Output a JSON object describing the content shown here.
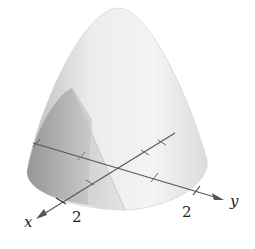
{
  "figure": {
    "type": "3d-surface-diagram",
    "colors": {
      "surface_light": "#f0f0f0",
      "surface_mid": "#d9d9d9",
      "surface_dark": "#9a9a9a",
      "axis": "#555555",
      "text": "#222222"
    },
    "axes": {
      "x": {
        "label": "x",
        "tick_label": "2"
      },
      "y": {
        "label": "y",
        "tick_label": "2"
      }
    }
  }
}
